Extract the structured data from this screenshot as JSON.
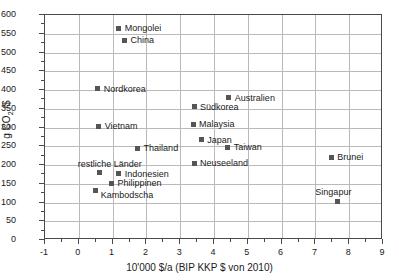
{
  "chart_data": {
    "type": "scatter",
    "title": "",
    "xlabel": "10'000 $/a (BIP KKP $ von 2010)",
    "ylabel": "g CO2 /$",
    "ylabel_main": "g CO",
    "ylabel_sub": "2",
    "ylabel_tail": " /$",
    "xlim": [
      -1,
      9
    ],
    "ylim": [
      0,
      600
    ],
    "xticks": [
      "-1",
      "0",
      "1",
      "2",
      "3",
      "4",
      "5",
      "6",
      "7",
      "8",
      "9"
    ],
    "yticks": [
      "0",
      "50",
      "100",
      "150",
      "200",
      "250",
      "300",
      "350",
      "400",
      "450",
      "500",
      "550",
      "600"
    ],
    "grid": true,
    "legend": "none",
    "marker": "filled-square",
    "marker_color": "#555555",
    "points": [
      {
        "label": "Mongolei",
        "x": 1.18,
        "y": 565,
        "label_pos": "right"
      },
      {
        "label": "China",
        "x": 1.35,
        "y": 533,
        "label_pos": "right"
      },
      {
        "label": "Nordkorea",
        "x": 0.56,
        "y": 403,
        "label_pos": "right"
      },
      {
        "label": "Australien",
        "x": 4.44,
        "y": 379,
        "label_pos": "right"
      },
      {
        "label": "Südkorea",
        "x": 3.41,
        "y": 355,
        "label_pos": "right"
      },
      {
        "label": "Malaysia",
        "x": 3.38,
        "y": 309,
        "label_pos": "right"
      },
      {
        "label": "Vietnam",
        "x": 0.59,
        "y": 303,
        "label_pos": "right"
      },
      {
        "label": "Japan",
        "x": 3.62,
        "y": 268,
        "label_pos": "right"
      },
      {
        "label": "Taiwan",
        "x": 4.41,
        "y": 248,
        "label_pos": "right"
      },
      {
        "label": "Thailand",
        "x": 1.74,
        "y": 245,
        "label_pos": "right"
      },
      {
        "label": "Brunei",
        "x": 7.47,
        "y": 221,
        "label_pos": "right"
      },
      {
        "label": "Neuseeland",
        "x": 3.41,
        "y": 205,
        "label_pos": "right"
      },
      {
        "label": "restliche Länder",
        "x": 0.62,
        "y": 179,
        "label_pos": "above"
      },
      {
        "label": "Indonesien",
        "x": 1.18,
        "y": 177,
        "label_pos": "right"
      },
      {
        "label": "Philippinen",
        "x": 0.97,
        "y": 151,
        "label_pos": "right"
      },
      {
        "label": "Kambodscha",
        "x": 0.5,
        "y": 133,
        "label_pos": "right-below"
      },
      {
        "label": "Singapur",
        "x": 7.65,
        "y": 104,
        "label_pos": "above"
      }
    ]
  }
}
